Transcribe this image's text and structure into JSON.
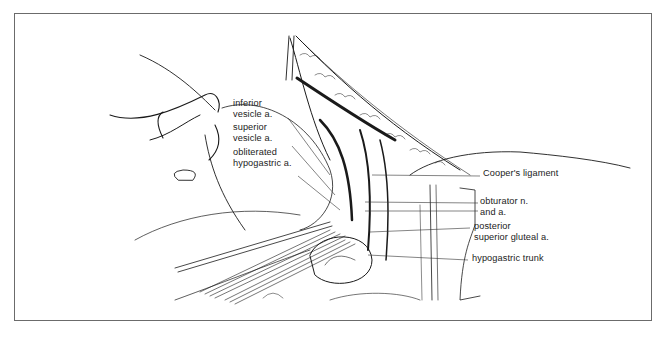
{
  "figure": {
    "frame_color": "#6b6b6b",
    "line_color": "#1a1a1a"
  },
  "labels_left": [
    {
      "id": "inferior-vesicle",
      "lines": [
        "inferior",
        "vesicle a."
      ]
    },
    {
      "id": "superior-vesicle",
      "lines": [
        "superior",
        "vesicle a."
      ]
    },
    {
      "id": "obliterated-hypogastric",
      "lines": [
        "obliterated",
        "hypogastric a."
      ]
    }
  ],
  "labels_right": [
    {
      "id": "coopers-ligament",
      "lines": [
        "Cooper's ligament"
      ]
    },
    {
      "id": "obturator",
      "lines": [
        "obturator n.",
        "and a."
      ]
    },
    {
      "id": "posterior-superior-gluteal",
      "lines": [
        "posterior",
        "superior gluteal a."
      ]
    },
    {
      "id": "hypogastric-trunk",
      "lines": [
        "hypogastric trunk"
      ]
    }
  ]
}
